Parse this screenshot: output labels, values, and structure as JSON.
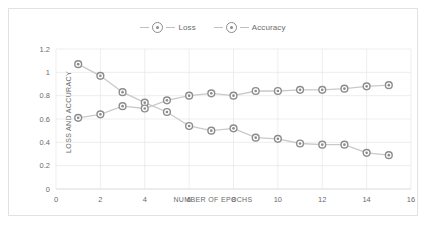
{
  "chart_data": {
    "type": "line",
    "title": "",
    "xlabel": "NUMBER OF EPOCHS",
    "ylabel": "LOSS AND ACCURACY",
    "x": [
      1,
      2,
      3,
      4,
      5,
      6,
      7,
      8,
      9,
      10,
      11,
      12,
      13,
      14,
      15
    ],
    "xlim": [
      0,
      16
    ],
    "ylim": [
      0,
      1.2
    ],
    "xticks": [
      "0",
      "2",
      "4",
      "6",
      "8",
      "10",
      "12",
      "14",
      "16"
    ],
    "xtick_values": [
      0,
      2,
      4,
      6,
      8,
      10,
      12,
      14,
      16
    ],
    "yticks": [
      "0",
      "0.2",
      "0.4",
      "0.6",
      "0.8",
      "1",
      "1.2"
    ],
    "ytick_values": [
      0,
      0.2,
      0.4,
      0.6,
      0.8,
      1,
      1.2
    ],
    "grid": true,
    "legend_position": "top-center",
    "series": [
      {
        "name": "Loss",
        "color": "#8c8c8c",
        "values": [
          1.07,
          0.97,
          0.83,
          0.74,
          0.66,
          0.54,
          0.5,
          0.52,
          0.44,
          0.43,
          0.39,
          0.38,
          0.38,
          0.31,
          0.29
        ]
      },
      {
        "name": "Accuracy",
        "color": "#8c8c8c",
        "values": [
          0.61,
          0.64,
          0.71,
          0.69,
          0.76,
          0.8,
          0.82,
          0.8,
          0.84,
          0.84,
          0.85,
          0.85,
          0.86,
          0.88,
          0.89
        ]
      }
    ]
  },
  "legend": {
    "items": [
      {
        "label": "Loss"
      },
      {
        "label": "Accuracy"
      }
    ]
  }
}
